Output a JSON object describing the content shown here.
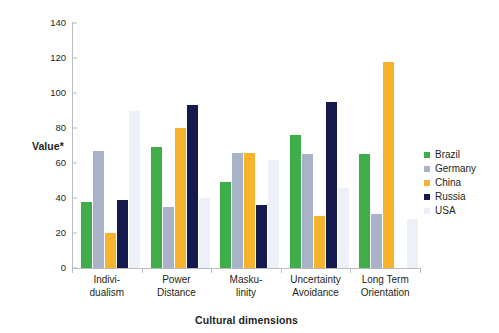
{
  "chart_data": {
    "type": "bar",
    "title": "",
    "xlabel": "Cultural dimensions",
    "ylabel": "Value*",
    "ylim": [
      0,
      140
    ],
    "ytick_step": 20,
    "yticks": [
      0,
      20,
      40,
      60,
      80,
      100,
      120,
      140
    ],
    "grid": false,
    "legend_position": "right",
    "categories": [
      "Indivi-\ndualism",
      "Power\nDistance",
      "Masku-\nlinity",
      "Uncertainty\nAvoidance",
      "Long Term\nOrientation"
    ],
    "category_lines": [
      [
        "Indivi-",
        "dualism"
      ],
      [
        "Power",
        "Distance"
      ],
      [
        "Masku-",
        "linity"
      ],
      [
        "Uncertainty",
        "Avoidance"
      ],
      [
        "Long Term",
        "Orientation"
      ]
    ],
    "series": [
      {
        "name": "Brazil",
        "color": "#3FAE49",
        "values": [
          38,
          69,
          49,
          76,
          65
        ]
      },
      {
        "name": "Germany",
        "color": "#A8B3C8",
        "values": [
          67,
          35,
          66,
          65,
          31
        ]
      },
      {
        "name": "China",
        "color": "#F7B32B",
        "values": [
          20,
          80,
          66,
          30,
          118
        ]
      },
      {
        "name": "Russia",
        "color": "#141A4E",
        "values": [
          39,
          93,
          36,
          95,
          0
        ]
      },
      {
        "name": "USA",
        "color": "#EDF1F7",
        "values": [
          90,
          40,
          62,
          46,
          28
        ]
      }
    ]
  }
}
